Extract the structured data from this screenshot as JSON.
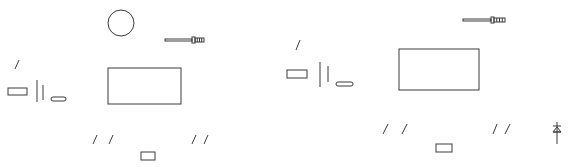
{
  "diagram": {
    "width": 577,
    "height": 167,
    "stroke_color": "#3a3a3a",
    "background": "#ffffff",
    "panels": [
      {
        "id": "left",
        "circle": {
          "cx": 121,
          "cy": 23,
          "r": 13
        },
        "probe": {
          "x": 165,
          "y": 40,
          "shaft_len": 27,
          "head_len": 9
        },
        "main_rect": {
          "x": 108,
          "y": 68,
          "w": 73,
          "h": 36
        },
        "slashes": [
          {
            "x1": 15,
            "y1": 69,
            "x2": 19,
            "y2": 60
          },
          {
            "x1": 93,
            "y1": 144,
            "x2": 97,
            "y2": 135
          },
          {
            "x1": 109,
            "y1": 144,
            "x2": 113,
            "y2": 135
          },
          {
            "x1": 192,
            "y1": 144,
            "x2": 196,
            "y2": 135
          },
          {
            "x1": 204,
            "y1": 144,
            "x2": 208,
            "y2": 135
          }
        ],
        "small_rect": {
          "x": 8,
          "y": 88,
          "w": 19,
          "h": 7
        },
        "bars": [
          {
            "x": 37,
            "y1": 80,
            "y2": 102
          },
          {
            "x": 43,
            "y1": 85,
            "y2": 100
          }
        ],
        "pill": {
          "x": 51,
          "y": 97,
          "w": 15,
          "h": 4
        },
        "bottom_rect": {
          "x": 141,
          "y": 152,
          "w": 14,
          "h": 8
        }
      },
      {
        "id": "right",
        "probe": {
          "x": 463,
          "y": 20,
          "shaft_len": 28,
          "head_len": 11
        },
        "main_rect": {
          "x": 399,
          "y": 49,
          "w": 80,
          "h": 41
        },
        "slashes": [
          {
            "x1": 296,
            "y1": 50,
            "x2": 300,
            "y2": 40
          },
          {
            "x1": 383,
            "y1": 134,
            "x2": 388,
            "y2": 124
          },
          {
            "x1": 402,
            "y1": 134,
            "x2": 407,
            "y2": 124
          },
          {
            "x1": 493,
            "y1": 134,
            "x2": 497,
            "y2": 124
          },
          {
            "x1": 505,
            "y1": 134,
            "x2": 510,
            "y2": 124
          }
        ],
        "small_rect": {
          "x": 287,
          "y": 70,
          "w": 20,
          "h": 8
        },
        "bars": [
          {
            "x": 320,
            "y1": 62,
            "y2": 87
          },
          {
            "x": 328,
            "y1": 66,
            "y2": 82
          }
        ],
        "pill": {
          "x": 336,
          "y": 82,
          "w": 17,
          "h": 4
        },
        "bottom_rect": {
          "x": 436,
          "y": 144,
          "w": 16,
          "h": 8
        },
        "diode": {
          "x": 557,
          "y_top": 122,
          "y_bottom": 144
        }
      }
    ]
  }
}
